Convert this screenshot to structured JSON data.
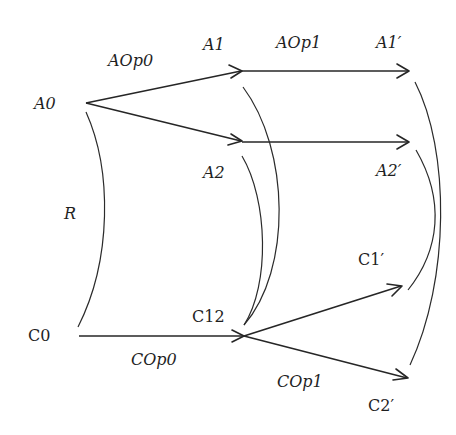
{
  "diagram": {
    "nodes": {
      "A0": "A0",
      "A1": "A1",
      "A2": "A2",
      "A1p": "A1′",
      "A2p": "A2′",
      "C0": "C0",
      "C12": "C12",
      "C1p": "C1′",
      "C2p": "C2′"
    },
    "edge_labels": {
      "AOp0": "AOp0",
      "AOp1": "AOp1",
      "COp0": "COp0",
      "COp1": "COp1",
      "R": "R"
    },
    "edges": [
      {
        "from": "A0",
        "to": "A1",
        "label": "AOp0"
      },
      {
        "from": "A0",
        "to": "A2"
      },
      {
        "from": "A1",
        "to": "A1′",
        "label": "AOp1"
      },
      {
        "from": "A2",
        "to": "A2′"
      },
      {
        "from": "C0",
        "to": "C12",
        "label": "COp0"
      },
      {
        "from": "C12",
        "to": "C1′",
        "label": "COp1"
      },
      {
        "from": "C12",
        "to": "C2′"
      }
    ],
    "relations": [
      {
        "from": "A0",
        "to": "C0",
        "label": "R"
      },
      {
        "from": "A1",
        "to": "C12"
      },
      {
        "from": "A2",
        "to": "C12"
      },
      {
        "from": "A1′",
        "to": "C2′"
      },
      {
        "from": "A2′",
        "to": "C1′"
      }
    ],
    "colors": {
      "ink": "#262626",
      "background": "#ffffff"
    }
  }
}
